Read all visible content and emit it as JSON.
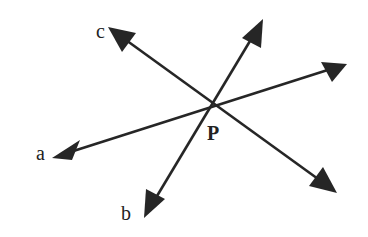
{
  "diagram": {
    "type": "intersecting-lines",
    "point": {
      "label": "P",
      "x": 213,
      "y": 105
    },
    "lines": [
      {
        "name": "line-a",
        "from": {
          "x": 52,
          "y": 158,
          "label": "a"
        },
        "to": {
          "x": 347,
          "y": 64,
          "label": ""
        }
      },
      {
        "name": "line-b",
        "from": {
          "x": 144,
          "y": 218,
          "label": "b"
        },
        "to": {
          "x": 263,
          "y": 19,
          "label": ""
        }
      },
      {
        "name": "line-c",
        "from": {
          "x": 108,
          "y": 27,
          "label": "c"
        },
        "to": {
          "x": 337,
          "y": 193,
          "label": ""
        }
      }
    ],
    "labels": {
      "a": "a",
      "b": "b",
      "c": "c",
      "p": "P"
    },
    "color": "#262626"
  }
}
